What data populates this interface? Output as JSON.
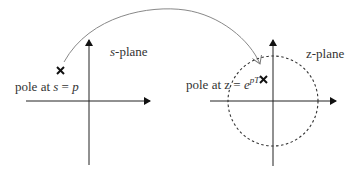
{
  "s_plane": {
    "label_var": "s",
    "label_rest": "-plane",
    "pole_label_prefix": "pole at ",
    "pole_label_var": "s",
    "pole_label_eq": " = ",
    "pole_label_val": "p",
    "pole_marker": "✕"
  },
  "z_plane": {
    "label": "z-plane",
    "pole_label_prefix": "pole at z = ",
    "pole_label_base": "e",
    "pole_label_exp": "pT",
    "pole_marker": "✕",
    "unit_circle": "dashed"
  },
  "mapping_arrow": {
    "from": "s-plane pole",
    "to": "z-plane pole"
  },
  "colors": {
    "axis": "#222222",
    "text": "#333333",
    "arc": "#888888",
    "circle": "#333333"
  }
}
